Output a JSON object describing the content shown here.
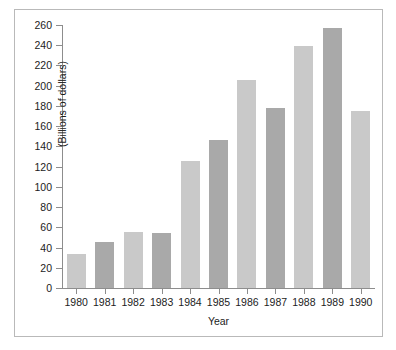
{
  "chart_data": {
    "type": "bar",
    "title": "",
    "xlabel": "Year",
    "ylabel": "(Billions of dollars)",
    "categories": [
      "1980",
      "1981",
      "1982",
      "1983",
      "1984",
      "1985",
      "1986",
      "1987",
      "1988",
      "1989",
      "1990"
    ],
    "values": [
      34,
      45,
      55,
      54,
      126,
      146,
      206,
      178,
      239,
      257,
      175
    ],
    "ylim": [
      0,
      260
    ],
    "ytick_step": 20,
    "yticks": [
      0,
      20,
      40,
      60,
      80,
      100,
      120,
      140,
      160,
      180,
      200,
      220,
      240,
      260
    ],
    "ytick_labels": [
      "0",
      "20",
      "40",
      "60",
      "80",
      "100",
      "120",
      "140",
      "160",
      "180",
      "200",
      "220",
      "240",
      "260"
    ],
    "grid": false,
    "legend": "none",
    "bar_colors": [
      "#c9c9c9",
      "#a9a9a9",
      "#c9c9c9",
      "#a9a9a9",
      "#c9c9c9",
      "#a9a9a9",
      "#c9c9c9",
      "#a9a9a9",
      "#c9c9c9",
      "#a9a9a9",
      "#c9c9c9"
    ],
    "series": [
      {
        "name": "",
        "values": [
          34,
          45,
          55,
          54,
          126,
          146,
          206,
          178,
          239,
          257,
          175
        ]
      }
    ],
    "colors": {
      "bar_light": "#c9c9c9",
      "bar_dark": "#a9a9a9",
      "axis": "#8d8d8d",
      "text": "#1c1c1c",
      "frame": "#b9b9b9",
      "background": "#ffffff"
    }
  }
}
